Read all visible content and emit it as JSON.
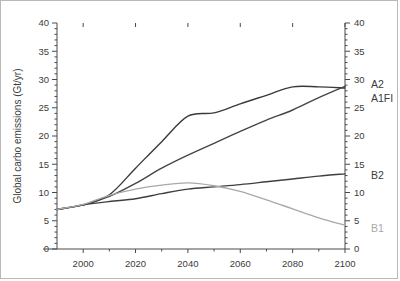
{
  "chart_data": {
    "type": "line",
    "title": "",
    "subtitle": "",
    "xlabel": "",
    "ylabel": "Global carbo emissions (Gt/yr)",
    "xlim": [
      1990,
      2100
    ],
    "ylim": [
      0,
      40
    ],
    "grid": false,
    "legend_position": "right-inline-labels",
    "x_ticks": [
      2000,
      2020,
      2040,
      2060,
      2080,
      2100
    ],
    "x_tick_labels": [
      "2000",
      "2020",
      "2040",
      "2060",
      "2080",
      "2100"
    ],
    "x_minor_interval": 10,
    "y_ticks": [
      0,
      5,
      10,
      15,
      20,
      25,
      30,
      35,
      40
    ],
    "y_tick_labels": [
      "0",
      "5",
      "10",
      "15",
      "20",
      "25",
      "30",
      "35",
      "40"
    ],
    "y_minor_interval": 1,
    "right_axis_ticks": [
      0,
      5,
      10,
      15,
      20,
      25,
      30,
      35,
      40
    ],
    "right_axis_tick_labels": [
      "0",
      "5",
      "10",
      "15",
      "20",
      "25",
      "30",
      "35",
      "40"
    ],
    "x": [
      1990,
      2000,
      2010,
      2020,
      2030,
      2040,
      2050,
      2060,
      2070,
      2080,
      2090,
      2100
    ],
    "series": [
      {
        "name": "A2",
        "color": "#3a3a3a",
        "label_value": 28.7,
        "values": [
          7.0,
          7.8,
          9.6,
          14.3,
          19.0,
          23.5,
          24.1,
          25.7,
          27.2,
          28.7,
          28.7,
          28.5
        ]
      },
      {
        "name": "A1FI",
        "color": "#454545",
        "label_value": 28.8,
        "values": [
          7.0,
          7.8,
          9.3,
          11.6,
          14.3,
          16.6,
          18.7,
          20.8,
          22.8,
          24.6,
          26.8,
          28.8
        ]
      },
      {
        "name": "B2",
        "color": "#3f3f3f",
        "label_value": 13.3,
        "values": [
          7.0,
          7.8,
          8.4,
          8.9,
          9.8,
          10.6,
          11.0,
          11.4,
          11.9,
          12.4,
          12.9,
          13.3
        ]
      },
      {
        "name": "B1",
        "color": "#a9a9a9",
        "label_value": 4.2,
        "values": [
          7.0,
          7.9,
          9.5,
          10.6,
          11.3,
          11.7,
          11.2,
          10.2,
          8.7,
          7.1,
          5.5,
          4.2
        ]
      }
    ],
    "annotations": [
      {
        "text": "A2",
        "series": "A2",
        "color": "#3b3b3b"
      },
      {
        "text": "A1FI",
        "series": "A1FI",
        "color": "#3b3b3b"
      },
      {
        "text": "B2",
        "series": "B2",
        "color": "#3b3b3b"
      },
      {
        "text": "B1",
        "series": "B1",
        "color": "#a9a9a9"
      }
    ]
  }
}
